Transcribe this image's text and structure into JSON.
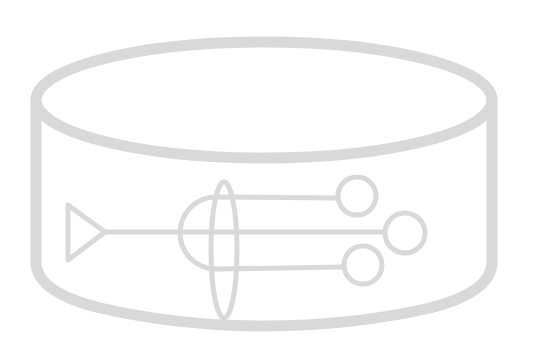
{
  "image": {
    "description": "Light gray line-art icon of a cylinder containing a circuit-like figure with a triangle, a semicircle, a vertical ellipse and three branches ending in circles",
    "icon": "cylinder-circuit-icon"
  },
  "colors": {
    "background": "#ffffff",
    "stroke": "#d9d9d9"
  },
  "shapes": {
    "cylinder": {
      "cx": 264,
      "top_cy": 100,
      "rx": 228,
      "ry": 58,
      "wall_bottom_y": 262,
      "bottom_cy": 270,
      "bottom_ry": 56,
      "stroke_width": 11
    },
    "triangle": {
      "points": "68,205 105,232 68,260",
      "stroke_width": 5
    },
    "main_line": {
      "x1": 105,
      "y1": 232,
      "x2": 386,
      "y2": 232
    },
    "semicircle": {
      "cx": 216,
      "cy": 233,
      "r": 36
    },
    "vertical_ellipse": {
      "cx": 224,
      "cy": 250,
      "rx": 13,
      "ry": 68
    },
    "branches": [
      {
        "name": "upper",
        "x1": 216,
        "y1": 197,
        "x2": 338,
        "y2": 198,
        "circle_cx": 357,
        "circle_cy": 196,
        "r": 19
      },
      {
        "name": "middle",
        "x1": 216,
        "y1": 232,
        "x2": 386,
        "y2": 232,
        "circle_cx": 405,
        "circle_cy": 233,
        "r": 20
      },
      {
        "name": "lower",
        "x1": 216,
        "y1": 269,
        "x2": 344,
        "y2": 267,
        "circle_cx": 363,
        "circle_cy": 265,
        "r": 19
      }
    ]
  }
}
